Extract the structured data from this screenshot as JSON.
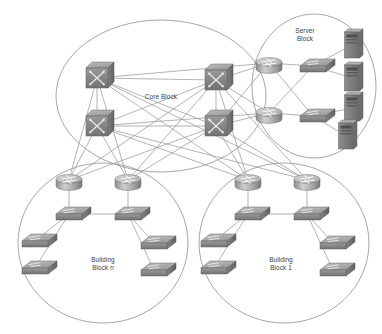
{
  "diagram": {
    "type": "network-topology-diagram",
    "background_color": "#ffffff",
    "outline_color": "#8f8f8f",
    "link_color": "#9a9a9a",
    "device_fill": "#9b9b9b",
    "device_dark": "#6f6f6f",
    "device_light": "#c2c2c2",
    "label_color": "#3d3d3d",
    "zones": [
      {
        "id": "core-block",
        "label": "Core Block",
        "label_lines": [
          "Core Block"
        ],
        "shape": "ellipse",
        "cx": 161,
        "cy": 96,
        "rx": 105,
        "ry": 76,
        "label_x": 161,
        "label_y": 99,
        "device_count": 4,
        "device_type": "multilayer-switch"
      },
      {
        "id": "server-block",
        "label": "Server Block",
        "label_lines": [
          "Server",
          "Block"
        ],
        "shape": "ellipse",
        "cx": 314,
        "cy": 86,
        "rx": 62,
        "ry": 72,
        "label_x": 305,
        "label_y": 33,
        "device_count": 8,
        "device_type": "router-switch-server"
      },
      {
        "id": "building-block-n",
        "label": "Building Block n",
        "label_lines": [
          "Building",
          "Block n"
        ],
        "shape": "ellipse",
        "cx": 103,
        "cy": 243,
        "rx": 85,
        "ry": 80,
        "label_x": 103,
        "label_y": 262,
        "device_count": 8,
        "device_type": "router-switch"
      },
      {
        "id": "building-block-1",
        "label": "Building Block 1",
        "label_lines": [
          "Building",
          "Block 1"
        ],
        "shape": "ellipse",
        "cx": 284,
        "cy": 243,
        "rx": 85,
        "ry": 80,
        "label_x": 281,
        "label_y": 262,
        "device_count": 8,
        "device_type": "router-switch"
      }
    ],
    "devices": [
      {
        "id": "core-sw-tl",
        "name": "core-switch-top-left",
        "kind": "multilayer-switch",
        "x": 97,
        "y": 78,
        "zone": "core-block"
      },
      {
        "id": "core-sw-tr",
        "name": "core-switch-top-right",
        "kind": "multilayer-switch",
        "x": 216,
        "y": 80,
        "zone": "core-block"
      },
      {
        "id": "core-sw-bl",
        "name": "core-switch-bottom-left",
        "kind": "multilayer-switch",
        "x": 97,
        "y": 126,
        "zone": "core-block"
      },
      {
        "id": "core-sw-br",
        "name": "core-switch-bottom-right",
        "kind": "multilayer-switch",
        "x": 216,
        "y": 126,
        "zone": "core-block"
      },
      {
        "id": "srv-rtr-1",
        "name": "server-block-router-top",
        "kind": "router",
        "x": 269,
        "y": 63,
        "zone": "server-block"
      },
      {
        "id": "srv-rtr-2",
        "name": "server-block-router-bottom",
        "kind": "router",
        "x": 269,
        "y": 113,
        "zone": "server-block"
      },
      {
        "id": "srv-sw-1",
        "name": "server-block-switch-top",
        "kind": "switch",
        "x": 313,
        "y": 66,
        "zone": "server-block"
      },
      {
        "id": "srv-sw-2",
        "name": "server-block-switch-bottom",
        "kind": "switch",
        "x": 313,
        "y": 116,
        "zone": "server-block"
      },
      {
        "id": "srv-1",
        "name": "server-tower-1",
        "kind": "server",
        "x": 352,
        "y": 45,
        "zone": "server-block"
      },
      {
        "id": "srv-2",
        "name": "server-tower-2",
        "kind": "server",
        "x": 352,
        "y": 78,
        "zone": "server-block"
      },
      {
        "id": "srv-3",
        "name": "server-tower-3",
        "kind": "server",
        "x": 352,
        "y": 108,
        "zone": "server-block"
      },
      {
        "id": "srv-4",
        "name": "server-tower-4",
        "kind": "server",
        "x": 346,
        "y": 136,
        "zone": "server-block"
      },
      {
        "id": "bn-rtr-l",
        "name": "bbn-router-left",
        "kind": "router",
        "x": 69,
        "y": 180,
        "zone": "building-block-n"
      },
      {
        "id": "bn-rtr-r",
        "name": "bbn-router-right",
        "kind": "router",
        "x": 128,
        "y": 180,
        "zone": "building-block-n"
      },
      {
        "id": "bn-dsw-l",
        "name": "bbn-dist-switch-left",
        "kind": "switch",
        "x": 69,
        "y": 214,
        "zone": "building-block-n"
      },
      {
        "id": "bn-dsw-r",
        "name": "bbn-dist-switch-right",
        "kind": "switch",
        "x": 128,
        "y": 214,
        "zone": "building-block-n"
      },
      {
        "id": "bn-asw-1",
        "name": "bbn-access-switch-1",
        "kind": "switch",
        "x": 35,
        "y": 241,
        "zone": "building-block-n"
      },
      {
        "id": "bn-asw-2",
        "name": "bbn-access-switch-2",
        "kind": "switch",
        "x": 35,
        "y": 268,
        "zone": "building-block-n"
      },
      {
        "id": "bn-asw-3",
        "name": "bbn-access-switch-3",
        "kind": "switch",
        "x": 154,
        "y": 243,
        "zone": "building-block-n"
      },
      {
        "id": "bn-asw-4",
        "name": "bbn-access-switch-4",
        "kind": "switch",
        "x": 154,
        "y": 270,
        "zone": "building-block-n"
      },
      {
        "id": "b1-rtr-l",
        "name": "bb1-router-left",
        "kind": "router",
        "x": 248,
        "y": 180,
        "zone": "building-block-1"
      },
      {
        "id": "b1-rtr-r",
        "name": "bb1-router-right",
        "kind": "router",
        "x": 307,
        "y": 180,
        "zone": "building-block-1"
      },
      {
        "id": "b1-dsw-l",
        "name": "bb1-dist-switch-left",
        "kind": "switch",
        "x": 248,
        "y": 214,
        "zone": "building-block-1"
      },
      {
        "id": "b1-dsw-r",
        "name": "bb1-dist-switch-right",
        "kind": "switch",
        "x": 307,
        "y": 214,
        "zone": "building-block-1"
      },
      {
        "id": "b1-asw-1",
        "name": "bb1-access-switch-1",
        "kind": "switch",
        "x": 214,
        "y": 241,
        "zone": "building-block-1"
      },
      {
        "id": "b1-asw-2",
        "name": "bb1-access-switch-2",
        "kind": "switch",
        "x": 214,
        "y": 268,
        "zone": "building-block-1"
      },
      {
        "id": "b1-asw-3",
        "name": "bb1-access-switch-3",
        "kind": "switch",
        "x": 333,
        "y": 243,
        "zone": "building-block-1"
      },
      {
        "id": "b1-asw-4",
        "name": "bb1-access-switch-4",
        "kind": "switch",
        "x": 333,
        "y": 270,
        "zone": "building-block-1"
      }
    ],
    "links": [
      [
        "core-sw-tl",
        "core-sw-tr"
      ],
      [
        "core-sw-tl",
        "core-sw-bl"
      ],
      [
        "core-sw-tr",
        "core-sw-br"
      ],
      [
        "core-sw-bl",
        "core-sw-br"
      ],
      [
        "core-sw-tl",
        "core-sw-br"
      ],
      [
        "core-sw-tr",
        "core-sw-bl"
      ],
      [
        "core-sw-tr",
        "srv-rtr-1"
      ],
      [
        "core-sw-tr",
        "srv-rtr-2"
      ],
      [
        "core-sw-br",
        "srv-rtr-1"
      ],
      [
        "core-sw-br",
        "srv-rtr-2"
      ],
      [
        "core-sw-tl",
        "srv-rtr-1"
      ],
      [
        "core-sw-bl",
        "srv-rtr-2"
      ],
      [
        "srv-rtr-1",
        "srv-sw-1"
      ],
      [
        "srv-rtr-1",
        "srv-sw-2"
      ],
      [
        "srv-rtr-2",
        "srv-sw-1"
      ],
      [
        "srv-rtr-2",
        "srv-sw-2"
      ],
      [
        "srv-sw-1",
        "srv-1"
      ],
      [
        "srv-sw-1",
        "srv-2"
      ],
      [
        "srv-sw-2",
        "srv-3"
      ],
      [
        "srv-sw-2",
        "srv-4"
      ],
      [
        "core-sw-tl",
        "bn-rtr-l"
      ],
      [
        "core-sw-tl",
        "bn-rtr-r"
      ],
      [
        "core-sw-bl",
        "bn-rtr-l"
      ],
      [
        "core-sw-bl",
        "bn-rtr-r"
      ],
      [
        "core-sw-tr",
        "bn-rtr-l"
      ],
      [
        "core-sw-tr",
        "bn-rtr-r"
      ],
      [
        "core-sw-br",
        "bn-rtr-l"
      ],
      [
        "core-sw-br",
        "bn-rtr-r"
      ],
      [
        "core-sw-tl",
        "b1-rtr-l"
      ],
      [
        "core-sw-tl",
        "b1-rtr-r"
      ],
      [
        "core-sw-bl",
        "b1-rtr-l"
      ],
      [
        "core-sw-bl",
        "b1-rtr-r"
      ],
      [
        "core-sw-tr",
        "b1-rtr-l"
      ],
      [
        "core-sw-tr",
        "b1-rtr-r"
      ],
      [
        "core-sw-br",
        "b1-rtr-l"
      ],
      [
        "core-sw-br",
        "b1-rtr-r"
      ],
      [
        "bn-rtr-l",
        "bn-dsw-l"
      ],
      [
        "bn-rtr-r",
        "bn-dsw-r"
      ],
      [
        "bn-dsw-l",
        "bn-dsw-r"
      ],
      [
        "bn-dsw-l",
        "bn-asw-1"
      ],
      [
        "bn-dsw-l",
        "bn-asw-2"
      ],
      [
        "bn-dsw-r",
        "bn-asw-3"
      ],
      [
        "bn-dsw-r",
        "bn-asw-4"
      ],
      [
        "b1-rtr-l",
        "b1-dsw-l"
      ],
      [
        "b1-rtr-r",
        "b1-dsw-r"
      ],
      [
        "b1-dsw-l",
        "b1-dsw-r"
      ],
      [
        "b1-dsw-l",
        "b1-asw-1"
      ],
      [
        "b1-dsw-l",
        "b1-asw-2"
      ],
      [
        "b1-dsw-r",
        "b1-asw-3"
      ],
      [
        "b1-dsw-r",
        "b1-asw-4"
      ]
    ]
  }
}
